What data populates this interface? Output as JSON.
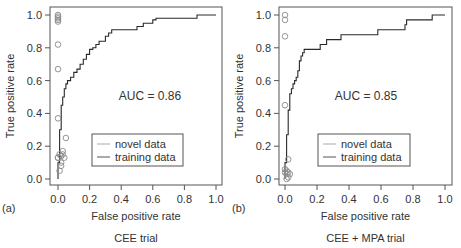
{
  "chart_data": [
    {
      "type": "line",
      "panel_label": "(a)",
      "title": "CEE trial",
      "xlabel": "False positive rate",
      "ylabel": "True positive rate",
      "xlim": [
        0,
        1
      ],
      "ylim": [
        0,
        1
      ],
      "xticks": [
        "0.0",
        "0.2",
        "0.4",
        "0.6",
        "0.8",
        "1.0"
      ],
      "yticks": [
        "0.0",
        "0.2",
        "0.4",
        "0.6",
        "0.8",
        "1.0"
      ],
      "annotation": "AUC = 0.86",
      "legend": [
        "novel data",
        "training data"
      ],
      "series": [
        {
          "name": "training data",
          "style": "step-line",
          "x": [
            0,
            0.0,
            0.01,
            0.01,
            0.02,
            0.02,
            0.03,
            0.03,
            0.04,
            0.04,
            0.05,
            0.05,
            0.06,
            0.06,
            0.08,
            0.08,
            0.1,
            0.1,
            0.12,
            0.12,
            0.14,
            0.14,
            0.16,
            0.16,
            0.18,
            0.18,
            0.2,
            0.2,
            0.22,
            0.22,
            0.24,
            0.24,
            0.26,
            0.26,
            0.3,
            0.3,
            0.32,
            0.32,
            0.34,
            0.34,
            0.5,
            0.5,
            0.54,
            0.54,
            0.6,
            0.6,
            0.62,
            0.62,
            0.88,
            0.88,
            1.0
          ],
          "y": [
            0,
            0.1,
            0.1,
            0.3,
            0.3,
            0.45,
            0.45,
            0.5,
            0.5,
            0.55,
            0.55,
            0.58,
            0.58,
            0.6,
            0.6,
            0.62,
            0.62,
            0.65,
            0.65,
            0.67,
            0.67,
            0.7,
            0.7,
            0.73,
            0.73,
            0.76,
            0.76,
            0.79,
            0.79,
            0.8,
            0.8,
            0.82,
            0.82,
            0.84,
            0.84,
            0.87,
            0.87,
            0.89,
            0.89,
            0.91,
            0.91,
            0.93,
            0.93,
            0.95,
            0.95,
            0.97,
            0.97,
            0.98,
            0.98,
            1.0,
            1.0
          ]
        },
        {
          "name": "novel data",
          "style": "circles",
          "x": [
            0,
            0,
            0,
            0,
            0,
            0,
            0,
            0,
            0,
            0,
            0.01,
            0.01,
            0.02,
            0.02,
            0.03,
            0.03,
            0.04,
            0.05,
            0.02
          ],
          "y": [
            1.0,
            0.99,
            0.98,
            0.97,
            0.96,
            0.82,
            0.67,
            0.37,
            0.13,
            0.13,
            0.15,
            0.05,
            0.14,
            0.08,
            0.17,
            0.15,
            0.13,
            0.25,
            0.1
          ]
        }
      ]
    },
    {
      "type": "line",
      "panel_label": "(b)",
      "title": "CEE + MPA trial",
      "xlabel": "False positive rate",
      "ylabel": "True positive rate",
      "xlim": [
        0,
        1
      ],
      "ylim": [
        0,
        1
      ],
      "xticks": [
        "0.0",
        "0.2",
        "0.4",
        "0.6",
        "0.8",
        "1.0"
      ],
      "yticks": [
        "0.0",
        "0.2",
        "0.4",
        "0.6",
        "0.8",
        "1.0"
      ],
      "annotation": "AUC = 0.85",
      "legend": [
        "novel data",
        "training data"
      ],
      "series": [
        {
          "name": "training data",
          "style": "step-line",
          "x": [
            0,
            0.0,
            0.01,
            0.01,
            0.02,
            0.02,
            0.03,
            0.03,
            0.04,
            0.04,
            0.05,
            0.05,
            0.06,
            0.06,
            0.07,
            0.07,
            0.08,
            0.08,
            0.09,
            0.09,
            0.1,
            0.1,
            0.11,
            0.11,
            0.12,
            0.12,
            0.22,
            0.22,
            0.26,
            0.26,
            0.35,
            0.35,
            0.58,
            0.58,
            0.75,
            0.75,
            0.76,
            0.76,
            0.92,
            0.92,
            1.0
          ],
          "y": [
            0,
            0.1,
            0.1,
            0.27,
            0.27,
            0.42,
            0.42,
            0.52,
            0.52,
            0.55,
            0.55,
            0.58,
            0.58,
            0.6,
            0.6,
            0.62,
            0.62,
            0.66,
            0.66,
            0.72,
            0.72,
            0.75,
            0.75,
            0.77,
            0.77,
            0.79,
            0.79,
            0.82,
            0.82,
            0.85,
            0.85,
            0.88,
            0.88,
            0.91,
            0.91,
            0.94,
            0.94,
            0.97,
            0.97,
            1.0,
            1.0
          ]
        },
        {
          "name": "novel data",
          "style": "circles",
          "x": [
            0,
            0,
            0,
            0,
            0,
            0,
            0.01,
            0.01,
            0.02,
            0.02,
            0.03,
            0.01,
            0.02
          ],
          "y": [
            1.0,
            0.97,
            0.87,
            0.45,
            0.06,
            0.04,
            0.03,
            0.05,
            0.12,
            0.04,
            0.03,
            0.0,
            0.01
          ]
        }
      ]
    }
  ]
}
